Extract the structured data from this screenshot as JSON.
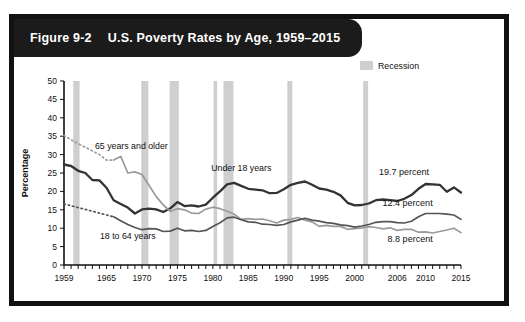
{
  "figure": {
    "number": "Figure 9-2",
    "title": "U.S. Poverty Rates by Age, 1959–2015"
  },
  "legend": {
    "recession_label": "Recession",
    "recession_color": "#cfcfcf"
  },
  "chart_data": {
    "type": "line",
    "title": "U.S. Poverty Rates by Age, 1959–2015",
    "xlabel": "",
    "ylabel": "Percentage",
    "xlim": [
      1959,
      2015
    ],
    "ylim": [
      0,
      50
    ],
    "ytick_step": 5,
    "yticks": [
      0,
      5,
      10,
      15,
      20,
      25,
      30,
      35,
      40,
      45,
      50
    ],
    "xtick_labels": [
      1959,
      1965,
      1970,
      1975,
      1980,
      1985,
      1990,
      1995,
      2000,
      2006,
      2010,
      2015
    ],
    "grid": false,
    "legend_position": "top-right",
    "annotations": [
      {
        "text": "65 years and older",
        "x": 1968.5,
        "y": 31.5
      },
      {
        "text": "Under 18 years",
        "x": 1984.0,
        "y": 25.5
      },
      {
        "text": "18 to 64 years",
        "x": 1968.0,
        "y": 7.2
      },
      {
        "text": "19.7 percent",
        "x": 2010.5,
        "y": 24.5
      },
      {
        "text": "12.4 percent",
        "x": 2011.0,
        "y": 16.0
      },
      {
        "text": "8.8 percent",
        "x": 2011.0,
        "y": 6.2
      }
    ],
    "recessions": [
      {
        "start": 1960.3,
        "end": 1961.2
      },
      {
        "start": 1969.9,
        "end": 1970.9
      },
      {
        "start": 1973.9,
        "end": 1975.2
      },
      {
        "start": 1980.1,
        "end": 1980.6
      },
      {
        "start": 1981.5,
        "end": 1982.9
      },
      {
        "start": 1990.5,
        "end": 1991.2
      },
      {
        "start": 2001.2,
        "end": 2001.9
      }
    ],
    "x": [
      1959,
      1960,
      1961,
      1962,
      1963,
      1964,
      1965,
      1966,
      1967,
      1968,
      1969,
      1970,
      1971,
      1972,
      1973,
      1974,
      1975,
      1976,
      1977,
      1978,
      1979,
      1980,
      1981,
      1982,
      1983,
      1984,
      1985,
      1986,
      1987,
      1988,
      1989,
      1990,
      1991,
      1992,
      1993,
      1994,
      1995,
      1996,
      1997,
      1998,
      1999,
      2000,
      2001,
      2002,
      2003,
      2004,
      2005,
      2006,
      2007,
      2008,
      2009,
      2010,
      2011,
      2012,
      2013,
      2014,
      2015
    ],
    "series": [
      {
        "name": "Under 18 years",
        "color": "#333333",
        "style": "solid",
        "end_label": "19.7 percent",
        "values": [
          27.3,
          26.9,
          25.6,
          25.0,
          23.1,
          23.0,
          21.0,
          17.6,
          16.6,
          15.6,
          14.0,
          15.1,
          15.3,
          15.1,
          14.4,
          15.4,
          17.1,
          16.0,
          16.2,
          15.9,
          16.4,
          18.3,
          20.0,
          21.9,
          22.3,
          21.5,
          20.7,
          20.5,
          20.3,
          19.5,
          19.6,
          20.6,
          21.8,
          22.3,
          22.7,
          21.8,
          20.8,
          20.5,
          19.9,
          18.9,
          16.9,
          16.2,
          16.3,
          16.7,
          17.6,
          17.8,
          17.6,
          17.4,
          18.0,
          19.0,
          20.7,
          22.0,
          21.9,
          21.8,
          19.9,
          21.1,
          19.7
        ]
      },
      {
        "name": "65 years and older",
        "color": "#9a9a9a",
        "style": "dotted-then-solid",
        "dotted_until": 1966,
        "end_label": "8.8 percent",
        "values": [
          35.2,
          34.0,
          33.0,
          32.0,
          31.0,
          30.0,
          28.5,
          28.5,
          29.5,
          25.0,
          25.3,
          24.6,
          21.6,
          18.6,
          16.3,
          14.6,
          15.3,
          15.0,
          14.1,
          14.0,
          15.2,
          15.7,
          15.3,
          14.6,
          13.8,
          12.4,
          12.6,
          12.4,
          12.5,
          12.0,
          11.4,
          12.2,
          12.4,
          12.9,
          12.2,
          11.7,
          10.5,
          10.8,
          10.5,
          10.5,
          9.7,
          9.9,
          10.1,
          10.4,
          10.2,
          9.8,
          10.1,
          9.4,
          9.7,
          9.7,
          8.9,
          9.0,
          8.7,
          9.1,
          9.5,
          10.0,
          8.8
        ]
      },
      {
        "name": "18 to 64 years",
        "color": "#555555",
        "style": "dotted-then-solid",
        "dotted_until": 1966,
        "end_label": "12.4 percent",
        "values": [
          16.6,
          16.1,
          15.6,
          15.1,
          14.6,
          14.1,
          13.6,
          13.1,
          12.0,
          11.0,
          10.2,
          9.6,
          9.9,
          9.8,
          9.1,
          9.2,
          10.0,
          9.3,
          9.4,
          9.1,
          9.4,
          10.5,
          11.5,
          12.8,
          13.0,
          12.3,
          11.7,
          11.6,
          11.1,
          11.0,
          10.8,
          11.0,
          11.7,
          12.2,
          12.7,
          12.2,
          11.9,
          11.5,
          11.3,
          10.9,
          10.7,
          10.3,
          10.6,
          11.0,
          11.6,
          11.8,
          11.8,
          11.5,
          11.4,
          11.9,
          13.1,
          14.0,
          14.0,
          14.0,
          13.8,
          13.6,
          12.4
        ]
      }
    ]
  }
}
